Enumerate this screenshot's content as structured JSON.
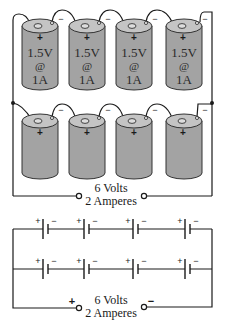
{
  "diagram": {
    "colors": {
      "battery_body": "#a3a3a3",
      "battery_top": "#c4c4c4",
      "wire": "#1a1a1a",
      "outline": "#333333"
    },
    "pictorial": {
      "top_row": {
        "cells": [
          {
            "voltage": "1.5V",
            "at": "@",
            "current": "1A",
            "positive": "+",
            "negative": "−"
          },
          {
            "voltage": "1.5V",
            "at": "@",
            "current": "1A",
            "positive": "+",
            "negative": "−"
          },
          {
            "voltage": "1.5V",
            "at": "@",
            "current": "1A",
            "positive": "+",
            "negative": "−"
          },
          {
            "voltage": "1.5V",
            "at": "@",
            "current": "1A",
            "positive": "+",
            "negative": "−"
          }
        ]
      },
      "bottom_row": {
        "cells": [
          {
            "positive": "+",
            "negative": "−"
          },
          {
            "positive": "+",
            "negative": "−"
          },
          {
            "positive": "+",
            "negative": "−"
          },
          {
            "positive": "+",
            "negative": "−"
          }
        ]
      },
      "output": {
        "voltage": "6 Volts",
        "current": "2 Amperes"
      }
    },
    "schematic": {
      "rows": [
        {
          "cells": [
            {
              "positive": "+",
              "negative": "−"
            },
            {
              "positive": "+",
              "negative": "−"
            },
            {
              "positive": "+",
              "negative": "−"
            },
            {
              "positive": "+",
              "negative": "−"
            }
          ]
        },
        {
          "cells": [
            {
              "positive": "+",
              "negative": "−"
            },
            {
              "positive": "+",
              "negative": "−"
            },
            {
              "positive": "+",
              "negative": "−"
            },
            {
              "positive": "+",
              "negative": "−"
            }
          ]
        }
      ],
      "output": {
        "voltage": "6 Volts",
        "current": "2 Amperes",
        "positive": "+",
        "negative": "−"
      }
    }
  }
}
